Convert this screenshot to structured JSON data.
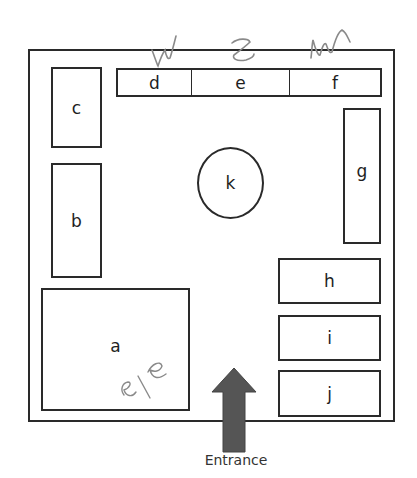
{
  "diagram": {
    "type": "floor-plan",
    "room_label": "",
    "areas": [
      {
        "id": "a",
        "label": "a"
      },
      {
        "id": "b",
        "label": "b"
      },
      {
        "id": "c",
        "label": "c"
      },
      {
        "id": "d",
        "label": "d"
      },
      {
        "id": "e",
        "label": "e"
      },
      {
        "id": "f",
        "label": "f"
      },
      {
        "id": "g",
        "label": "g"
      },
      {
        "id": "h",
        "label": "h"
      },
      {
        "id": "i",
        "label": "i"
      },
      {
        "id": "j",
        "label": "j"
      },
      {
        "id": "k",
        "label": "k",
        "shape": "circle"
      }
    ],
    "entrance": {
      "label": "Entrance",
      "arrow_color": "#555555"
    },
    "handwritten_annotations": [
      {
        "near": "d",
        "text": "W"
      },
      {
        "near": "e",
        "text": "Z"
      },
      {
        "near": "f",
        "text": "M"
      },
      {
        "near": "a",
        "text": "e/e"
      }
    ]
  }
}
